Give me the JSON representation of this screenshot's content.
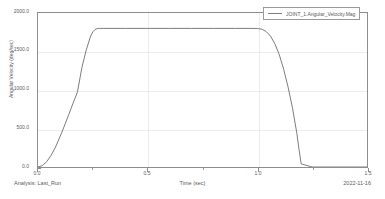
{
  "chart_data": {
    "type": "line",
    "title": "",
    "xlabel": "Time (sec)",
    "ylabel": "Angular Velocity (deg/sec)",
    "xlim": [
      0.0,
      1.5
    ],
    "ylim": [
      0.0,
      2000.0
    ],
    "xticks": [
      "0.0",
      "0.5",
      "1.0",
      "1.5"
    ],
    "xtick_values": [
      0.0,
      0.5,
      1.0,
      1.5
    ],
    "yticks": [
      "0.0",
      "500.0",
      "1000.0",
      "1500.0",
      "2000.0"
    ],
    "ytick_values": [
      0.0,
      500.0,
      1000.0,
      1500.0,
      2000.0
    ],
    "grid": true,
    "legend_position": "top-right",
    "series": [
      {
        "name": "JOINT_1.Angular_Velocity.Mag",
        "color": "#7d7d7d",
        "x": [
          0.0,
          0.02,
          0.04,
          0.06,
          0.08,
          0.1,
          0.12,
          0.14,
          0.16,
          0.18,
          0.2,
          0.22,
          0.24,
          0.25,
          0.26,
          0.27,
          0.28,
          0.3,
          0.4,
          0.5,
          0.6,
          0.7,
          0.8,
          0.9,
          0.98,
          1.0,
          1.02,
          1.04,
          1.06,
          1.08,
          1.1,
          1.12,
          1.14,
          1.16,
          1.18,
          1.19,
          1.2,
          1.25,
          1.3,
          1.4,
          1.5
        ],
        "y": [
          0,
          18,
          70,
          152,
          260,
          390,
          532,
          680,
          830,
          975,
          1290,
          1520,
          1700,
          1755,
          1785,
          1798,
          1800,
          1800,
          1800,
          1800,
          1800,
          1800,
          1800,
          1800,
          1800,
          1798,
          1790,
          1760,
          1700,
          1600,
          1460,
          1270,
          1040,
          770,
          440,
          230,
          40,
          0,
          0,
          0,
          0
        ]
      }
    ]
  },
  "legend": {
    "entries": [
      {
        "label": "JOINT_1.Angular_Velocity.Mag"
      }
    ]
  },
  "footer": {
    "analysis_label": "Analysis:  Last_Run",
    "date": "2022-11-16"
  }
}
